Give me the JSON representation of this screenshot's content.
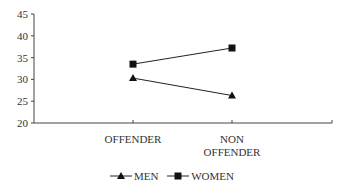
{
  "chart_data": {
    "type": "line",
    "title": "",
    "xlabel": "",
    "ylabel": "",
    "categories": [
      "OFFENDER",
      "NON OFFENDER"
    ],
    "category_lines": [
      [
        "OFFENDER"
      ],
      [
        "NON",
        "OFFENDER"
      ]
    ],
    "series": [
      {
        "name": "MEN",
        "marker": "triangle",
        "values": [
          30.3,
          26.3
        ]
      },
      {
        "name": "WOMEN",
        "marker": "square",
        "values": [
          33.5,
          37.2
        ]
      }
    ],
    "ylim": [
      20,
      45
    ],
    "yticks": [
      20,
      25,
      30,
      35,
      40,
      45
    ],
    "grid": false,
    "legend_position": "bottom"
  },
  "legend": {
    "men_label": "MEN",
    "women_label": "WOMEN"
  },
  "colors": {
    "line": "#222222",
    "axis": "#444444"
  }
}
